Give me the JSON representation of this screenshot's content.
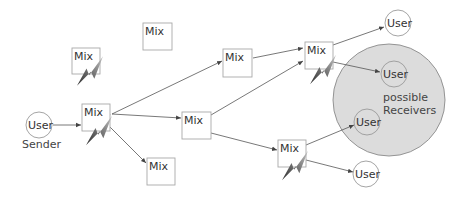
{
  "diagram": {
    "type": "mix-network",
    "colors": {
      "receivers_region": "#dcdcdc",
      "box_stroke": "#a8a8a8",
      "edge": "#555555",
      "bolt_dark": "#3a3a3a",
      "bolt_light": "#b0b0b0"
    },
    "nodes": {
      "mix_top_left": {
        "label": "Mix",
        "compromised": true
      },
      "mix_top_center": {
        "label": "Mix",
        "compromised": false
      },
      "mix_sender": {
        "label": "Mix",
        "compromised": true
      },
      "mix_bottom": {
        "label": "Mix",
        "compromised": false
      },
      "mix_center": {
        "label": "Mix",
        "compromised": false
      },
      "mix_upper_middle": {
        "label": "Mix",
        "compromised": false
      },
      "mix_right_top": {
        "label": "Mix",
        "compromised": true
      },
      "mix_right_bottom": {
        "label": "Mix",
        "compromised": true
      },
      "user_sender": {
        "label": "User",
        "caption": "Sender"
      },
      "user_top_right": {
        "label": "User"
      },
      "user_receiver_1": {
        "label": "User"
      },
      "user_receiver_2": {
        "label": "User"
      },
      "user_bottom_right": {
        "label": "User"
      }
    },
    "region": {
      "label_line1": "possible",
      "label_line2": "Receivers"
    },
    "edges": [
      {
        "from": "user_sender",
        "to": "mix_sender"
      },
      {
        "from": "mix_sender",
        "to": "mix_upper_middle"
      },
      {
        "from": "mix_sender",
        "to": "mix_center"
      },
      {
        "from": "mix_sender",
        "to": "mix_bottom"
      },
      {
        "from": "mix_sender",
        "to": "mix_right_top"
      },
      {
        "from": "mix_upper_middle",
        "to": "mix_right_top"
      },
      {
        "from": "mix_center",
        "to": "mix_right_top"
      },
      {
        "from": "mix_center",
        "to": "mix_right_bottom"
      },
      {
        "from": "mix_right_top",
        "to": "user_top_right"
      },
      {
        "from": "mix_right_top",
        "to": "user_receiver_1"
      },
      {
        "from": "mix_right_bottom",
        "to": "user_receiver_2"
      },
      {
        "from": "mix_right_bottom",
        "to": "user_bottom_right"
      }
    ]
  }
}
